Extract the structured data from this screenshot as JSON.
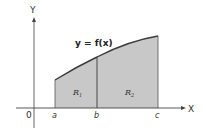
{
  "diagram": {
    "y_axis_label": "Y",
    "x_axis_label": "X",
    "origin_label": "0",
    "equation": "y = f(x)",
    "points": [
      {
        "label": "a"
      },
      {
        "label": "b"
      },
      {
        "label": "c"
      }
    ],
    "regions": [
      {
        "label": "R",
        "subscript": "1"
      },
      {
        "label": "R",
        "subscript": "2"
      }
    ],
    "colors": {
      "shade": "#c8c8c8",
      "line": "#3a3a3a",
      "axis": "#444444"
    }
  }
}
